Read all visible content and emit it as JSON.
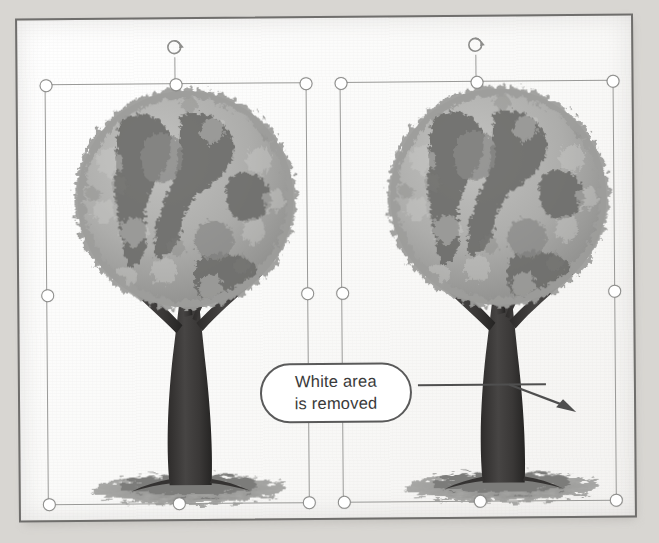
{
  "document": {
    "type": "scanned-book-page",
    "background_color": "#d8d6d2",
    "page_color": "#fbfbfa",
    "border_color": "#6f6e6c"
  },
  "callout": {
    "line1": "White area",
    "line2": "is removed",
    "border_color": "#5a5a5a",
    "fill_color": "#ffffff",
    "text_color": "#3a3a3a"
  },
  "annotation": {
    "leader_color": "#4f4f4f",
    "arrow_target": "right-tree-image"
  },
  "images": [
    {
      "id": "left-tree-image",
      "name": "tree-globe-with-white-background",
      "alt": "Tree whose canopy is a globe of leaves, shown with white background",
      "selected": true,
      "rotation_handle": true
    },
    {
      "id": "right-tree-image",
      "name": "tree-globe-transparent-background",
      "alt": "Same tree with the white background area removed",
      "selected": true,
      "rotation_handle": true
    }
  ],
  "selection": {
    "handle_fill": "#ffffff",
    "handle_stroke": "#8d8d8b",
    "box_stroke": "#9a9a98",
    "handle_positions": [
      "top-left",
      "top-center",
      "top-right",
      "middle-left",
      "middle-right",
      "bottom-left",
      "bottom-center",
      "bottom-right"
    ]
  },
  "artwork": {
    "foliage_light": "#b5b5b3",
    "foliage_mid": "#9a9a97",
    "foliage_dark": "#6e6e6c",
    "trunk_color": "#3f3d3c",
    "ground_color": "#8c8c8a"
  }
}
